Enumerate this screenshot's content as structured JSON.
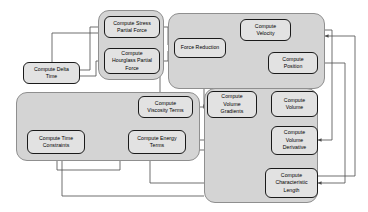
{
  "diagram": {
    "colors": {
      "group_fill": "#d4d4d4",
      "group_stroke": "#8f8f8f",
      "node_fill": "#e2e2e2",
      "node_stroke": "#1a1a1a",
      "edge_stroke": "#555555",
      "background": "#ffffff"
    },
    "groups": [
      {
        "id": "group-forces",
        "x": 98,
        "y": 10,
        "w": 66,
        "h": 70
      },
      {
        "id": "group-integration",
        "x": 168,
        "y": 13,
        "w": 157,
        "h": 76
      },
      {
        "id": "group-terms",
        "x": 16,
        "y": 92,
        "w": 184,
        "h": 69
      },
      {
        "id": "group-volume",
        "x": 204,
        "y": 88,
        "w": 114,
        "h": 115
      }
    ],
    "nodes": [
      {
        "id": "compute-stress-partial-force",
        "label": "Compute Stress\nPartial Force",
        "x": 104,
        "y": 16,
        "w": 56,
        "h": 22
      },
      {
        "id": "compute-hourglass-partial-force",
        "label": "Compute\nHourglass Partial\nForce",
        "x": 104,
        "y": 48,
        "w": 56,
        "h": 26
      },
      {
        "id": "compute-delta-time",
        "label": "Compute Delta\nTime",
        "x": 23,
        "y": 62,
        "w": 57,
        "h": 22
      },
      {
        "id": "force-reduction",
        "label": "Force Reduction",
        "x": 174,
        "y": 38,
        "w": 52,
        "h": 20
      },
      {
        "id": "compute-velocity",
        "label": "Compute\nVelocity",
        "x": 240,
        "y": 19,
        "w": 51,
        "h": 22
      },
      {
        "id": "compute-position",
        "label": "Compute\nPosition",
        "x": 268,
        "y": 52,
        "w": 50,
        "h": 22
      },
      {
        "id": "compute-viscosity-terms",
        "label": "Compute\nViscosity Terms",
        "x": 138,
        "y": 96,
        "w": 55,
        "h": 22
      },
      {
        "id": "compute-time-constraints",
        "label": "Compute Time\nConstraints",
        "x": 27,
        "y": 130,
        "w": 58,
        "h": 24
      },
      {
        "id": "compute-energy-terms",
        "label": "Compute Energy\nTerms",
        "x": 128,
        "y": 130,
        "w": 58,
        "h": 24
      },
      {
        "id": "compute-volume-gradients",
        "label": "Compute\nVolume\nGradients",
        "x": 207,
        "y": 91,
        "w": 50,
        "h": 27
      },
      {
        "id": "compute-volume",
        "label": "Compute\nVolume",
        "x": 271,
        "y": 91,
        "w": 47,
        "h": 26
      },
      {
        "id": "compute-volume-derivative",
        "label": "Compute\nVolume\nDerivative",
        "x": 271,
        "y": 126,
        "w": 47,
        "h": 29
      },
      {
        "id": "compute-characteristic-length",
        "label": "Compute\nCharacteristic\nLength",
        "x": 265,
        "y": 168,
        "w": 53,
        "h": 30
      }
    ],
    "edges": [
      {
        "id": "edge-delta-to-stress",
        "from": "compute-delta-time",
        "to": "compute-stress-partial-force",
        "path": "M 80 70 L 90 70 L 90 27 L 104 27"
      },
      {
        "id": "edge-delta-to-hourglass",
        "from": "compute-delta-time",
        "to": "compute-hourglass-partial-force",
        "path": "M 80 76 L 96 76 L 96 61 L 104 61"
      },
      {
        "id": "edge-stress-to-reduction",
        "from": "compute-stress-partial-force",
        "to": "force-reduction",
        "path": "M 160 27 L 168 27 L 168 45 L 174 45"
      },
      {
        "id": "edge-hourglass-to-reduction",
        "from": "compute-hourglass-partial-force",
        "to": "force-reduction",
        "path": "M 160 61 L 168 61 L 168 51 L 174 51"
      },
      {
        "id": "edge-reduction-to-velocity",
        "from": "force-reduction",
        "to": "compute-velocity",
        "path": "M 226 45 L 234 45 L 234 30 L 240 30"
      },
      {
        "id": "edge-velocity-to-position",
        "from": "compute-velocity",
        "to": "compute-position",
        "path": "M 283 41 L 283 48 L 293 48 L 293 52"
      },
      {
        "id": "edge-velocity-down-left",
        "from": "compute-velocity",
        "to": "compute-volume-gradients",
        "path": "M 252 41 L 252 84 L 204 84 L 204 106 L 207 106"
      },
      {
        "id": "edge-velocity-down-volume",
        "from": "compute-velocity",
        "to": "compute-volume",
        "path": "M 266 41 L 266 84 L 281 84 L 281 91"
      },
      {
        "id": "edge-position-down",
        "from": "compute-position",
        "to": "compute-volume",
        "path": "M 300 74 L 300 91"
      },
      {
        "id": "edge-position-right-out",
        "from": "compute-position",
        "to": "compute-characteristic-length",
        "path": "M 318 63 L 345 63 L 345 183 L 318 183"
      },
      {
        "id": "edge-velocity-right-out",
        "from": "compute-velocity",
        "to": "compute-volume-derivative",
        "path": "M 291 30 L 332 30 L 332 140 L 318 140"
      },
      {
        "id": "edge-viscosity-to-energy",
        "from": "compute-viscosity-terms",
        "to": "compute-energy-terms",
        "path": "M 160 118 L 160 124 L 150 124 L 150 130"
      },
      {
        "id": "edge-viscosity-to-gradients",
        "from": "compute-viscosity-terms",
        "to": "compute-volume-gradients",
        "path": "M 193 107 L 207 107"
      },
      {
        "id": "edge-energy-to-time",
        "from": "compute-energy-terms",
        "to": "compute-time-constraints",
        "path": "M 128 142 L 85 142"
      },
      {
        "id": "edge-energy-to-volderiv",
        "from": "compute-energy-terms",
        "to": "compute-volume-derivative",
        "path": "M 186 140 L 271 140"
      },
      {
        "id": "edge-gradients-to-volume",
        "from": "compute-volume-gradients",
        "to": "compute-volume",
        "path": "M 257 104 L 271 104"
      },
      {
        "id": "edge-volume-to-derivative",
        "from": "compute-volume",
        "to": "compute-volume-derivative",
        "path": "M 294 117 L 294 126"
      },
      {
        "id": "edge-volume-down-charlen",
        "from": "compute-volume",
        "to": "compute-characteristic-length",
        "path": "M 280 117 L 280 162 L 292 162 L 292 168"
      },
      {
        "id": "edge-charlen-left-out",
        "from": "compute-characteristic-length",
        "to": "compute-time-constraints",
        "path": "M 265 183 L 150 183 L 150 161 L 150 156"
      },
      {
        "id": "edge-charlen-right-up",
        "from": "compute-characteristic-length",
        "to": "compute-volume-gradients",
        "path": "M 318 176 L 355 176 L 355 36 L 325 36"
      },
      {
        "id": "edge-volderiv-left-out",
        "from": "compute-volume-derivative",
        "to": "compute-time-constraints",
        "path": "M 271 150 L 120 150 L 120 170 L 57 170 L 57 154"
      },
      {
        "id": "edge-delta-top-route",
        "from": "compute-delta-time",
        "to": "compute-viscosity-terms",
        "path": "M 52 62 L 52 33 L 160 33 L 160 96"
      },
      {
        "id": "edge-volderiv-bottom-route",
        "from": "compute-volume-derivative",
        "to": "compute-time-constraints",
        "path": "M 204 196 L 62 196 L 62 162 L 62 156"
      }
    ]
  }
}
